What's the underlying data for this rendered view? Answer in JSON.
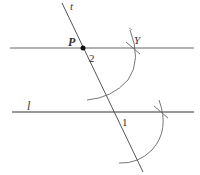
{
  "figure": {
    "colors": {
      "line": "#555555",
      "line_l": "#333333",
      "arc": "#666666",
      "point": "#111111",
      "label": "#333333"
    },
    "labels": {
      "transversal": "t",
      "point": "P",
      "intersection_mark": "Y",
      "line": "l",
      "angle_1": "1",
      "angle_2": "2"
    },
    "elements": {
      "transversal_t": {
        "x1": 62,
        "y1": 3,
        "x2": 143,
        "y2": 172
      },
      "parallel_line": {
        "x1": 10,
        "y1": 48,
        "x2": 194,
        "y2": 48
      },
      "line_l": {
        "x1": 12,
        "y1": 112,
        "x2": 194,
        "y2": 112
      },
      "point_P": {
        "cx": 83,
        "cy": 48,
        "r": 2.5
      }
    }
  }
}
